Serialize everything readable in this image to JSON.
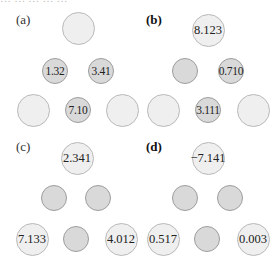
{
  "caption_cutoff": "… … … … …",
  "panels": [
    {
      "label": "(a)",
      "bold": false,
      "label_pos": [
        16,
        19
      ],
      "nodes": [
        {
          "type": "large",
          "x": 78,
          "y": 28,
          "value": ""
        },
        {
          "type": "small",
          "x": 55,
          "y": 71,
          "value": "1.32"
        },
        {
          "type": "small",
          "x": 101,
          "y": 71,
          "value": "3.41"
        },
        {
          "type": "large",
          "x": 33,
          "y": 110,
          "value": ""
        },
        {
          "type": "small",
          "x": 78,
          "y": 110,
          "value": "7.10"
        },
        {
          "type": "large",
          "x": 122,
          "y": 110,
          "value": ""
        }
      ]
    },
    {
      "label": "(b)",
      "bold": true,
      "label_pos": [
        146,
        19
      ],
      "nodes": [
        {
          "type": "large",
          "x": 208,
          "y": 30,
          "value": "8.123"
        },
        {
          "type": "small",
          "x": 185,
          "y": 71,
          "value": ""
        },
        {
          "type": "small",
          "x": 231,
          "y": 71,
          "value": "0.710"
        },
        {
          "type": "large",
          "x": 163,
          "y": 110,
          "value": ""
        },
        {
          "type": "small",
          "x": 208,
          "y": 110,
          "value": "3.111"
        },
        {
          "type": "large",
          "x": 253,
          "y": 110,
          "value": ""
        }
      ]
    },
    {
      "label": "(c)",
      "bold": false,
      "label_pos": [
        16,
        146
      ],
      "nodes": [
        {
          "type": "large",
          "x": 77,
          "y": 158,
          "value": "2.341"
        },
        {
          "type": "small",
          "x": 54,
          "y": 198,
          "value": ""
        },
        {
          "type": "small",
          "x": 98,
          "y": 198,
          "value": ""
        },
        {
          "type": "large",
          "x": 32,
          "y": 239,
          "value": "7.133"
        },
        {
          "type": "small",
          "x": 76,
          "y": 239,
          "value": ""
        },
        {
          "type": "large",
          "x": 121,
          "y": 239,
          "value": "4.012"
        }
      ]
    },
    {
      "label": "(d)",
      "bold": true,
      "label_pos": [
        146,
        146
      ],
      "nodes": [
        {
          "type": "large",
          "x": 208,
          "y": 158,
          "value": "−7.141"
        },
        {
          "type": "small",
          "x": 185,
          "y": 198,
          "value": ""
        },
        {
          "type": "small",
          "x": 230,
          "y": 198,
          "value": ""
        },
        {
          "type": "large",
          "x": 163,
          "y": 239,
          "value": "0.517"
        },
        {
          "type": "small",
          "x": 207,
          "y": 239,
          "value": ""
        },
        {
          "type": "large",
          "x": 253,
          "y": 239,
          "value": "0.003"
        }
      ]
    }
  ],
  "colors": {
    "large_fill": "#efefef",
    "large_border": "#b9b9b9",
    "small_fill": "#d9d9d9",
    "small_border": "#9d9d9d"
  }
}
